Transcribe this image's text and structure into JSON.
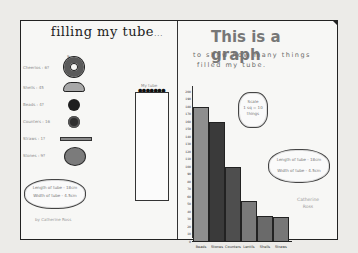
{
  "left_panel": {
    "title": "filling my tube",
    "title_suffix": "...",
    "top_mark": "9",
    "items": [
      {
        "label": "Cheerios : 6?",
        "icon": "ring-cereal-icon"
      },
      {
        "label": "Shells : 45",
        "icon": "shell-icon"
      },
      {
        "label": "Beads : 4?",
        "icon": "bead-icon"
      },
      {
        "label": "Counters : 16",
        "icon": "counter-icon"
      },
      {
        "label": "Straws : 1?",
        "icon": "straw-icon"
      },
      {
        "label": "Stones : 9?",
        "icon": "stone-icon"
      }
    ],
    "measurement_cloud": {
      "line1": "Length of tube - 18cm",
      "line2": "Width of tube - 4.5cm"
    },
    "author": "by Catherine Ross",
    "tube": {
      "label": "My tube",
      "cap_dots": "●●●●●●●"
    }
  },
  "right_panel": {
    "title": "This is a graph",
    "subtitle_line1": "to show how many things",
    "subtitle_line2": "filled my tube.",
    "scale_cloud": {
      "line1": "Scale",
      "line2": "1 sq = 10",
      "line3": "things"
    },
    "measurement_cloud": {
      "line1": "Length of tube - 18cm",
      "line2": "Width of tube - 4.5cm"
    },
    "author_line1": "Catherine",
    "author_line2": "Ross"
  },
  "chart_data": {
    "type": "bar",
    "categories": [
      "Beads",
      "Stones",
      "Counters",
      "Lentils",
      "Shells",
      "Straws"
    ],
    "values": [
      180,
      160,
      100,
      55,
      35,
      33
    ],
    "colors": [
      "#8e8e8e",
      "#3a3a3a",
      "#4e4e4e",
      "#7a7a7a",
      "#6a6a6a",
      "#777777"
    ],
    "xlabel": "",
    "ylabel": "",
    "ylim": [
      0,
      200
    ],
    "yticks": [
      0,
      10,
      20,
      30,
      40,
      50,
      60,
      70,
      80,
      90,
      100,
      110,
      120,
      130,
      140,
      150,
      160,
      170,
      180,
      190,
      200
    ],
    "grid": false,
    "legend": "none"
  }
}
